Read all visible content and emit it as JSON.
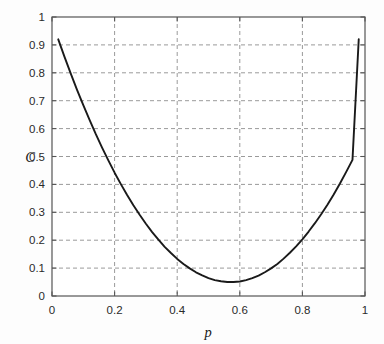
{
  "chart_data": {
    "type": "line",
    "title": "",
    "subtitle": "",
    "xlabel": "p",
    "ylabel": "C",
    "xlim": [
      0,
      1
    ],
    "ylim": [
      0,
      1
    ],
    "grid": true,
    "legend": null,
    "legend_position": "none",
    "xticks": [
      0,
      0.2,
      0.4,
      0.6,
      0.8,
      1
    ],
    "xticklabels": [
      "0",
      "0.2",
      "0.4",
      "0.6",
      "0.8",
      "1"
    ],
    "yticks": [
      0,
      0.1,
      0.2,
      0.3,
      0.4,
      0.5,
      0.6,
      0.7,
      0.8,
      0.9,
      1
    ],
    "yticklabels": [
      "0",
      "0.1",
      "0.2",
      "0.3",
      "0.4",
      "0.5",
      "0.6",
      "0.7",
      "0.8",
      "0.9",
      "1"
    ],
    "minor_gridlines_y": [
      0.1,
      0.2,
      0.3,
      0.4,
      0.5,
      0.6,
      0.7,
      0.8,
      0.9
    ],
    "minor_gridlines_x": [
      0.2,
      0.4,
      0.6,
      0.8
    ],
    "series": [
      {
        "name": "C(p)",
        "color": "#1a1a1a",
        "line_style": "solid",
        "line_width": 1.9,
        "x": [
          0.02,
          0.04,
          0.06,
          0.08,
          0.1,
          0.12,
          0.14,
          0.16,
          0.18,
          0.2,
          0.22,
          0.24,
          0.26,
          0.28,
          0.3,
          0.32,
          0.34,
          0.36,
          0.38,
          0.4,
          0.42,
          0.44,
          0.46,
          0.48,
          0.5,
          0.52,
          0.54,
          0.56,
          0.58,
          0.6,
          0.62,
          0.64,
          0.66,
          0.68,
          0.7,
          0.72,
          0.74,
          0.76,
          0.78,
          0.8,
          0.82,
          0.84,
          0.86,
          0.88,
          0.9,
          0.92,
          0.94,
          0.96,
          0.98
        ],
        "y": [
          0.92,
          0.857,
          0.797,
          0.739,
          0.684,
          0.631,
          0.58,
          0.532,
          0.486,
          0.442,
          0.401,
          0.362,
          0.325,
          0.291,
          0.259,
          0.229,
          0.202,
          0.176,
          0.154,
          0.133,
          0.115,
          0.099,
          0.085,
          0.074,
          0.064,
          0.057,
          0.053,
          0.05,
          0.05,
          0.052,
          0.057,
          0.064,
          0.073,
          0.085,
          0.099,
          0.115,
          0.134,
          0.155,
          0.178,
          0.203,
          0.231,
          0.261,
          0.293,
          0.327,
          0.364,
          0.403,
          0.445,
          0.488,
          0.92
        ]
      }
    ],
    "annotations": []
  },
  "colors": {
    "axis": "#555555",
    "grid": "#9a9a9a",
    "curve": "#1a1a1a",
    "background": "#fdfdfd",
    "text": "#2a2a2a"
  }
}
